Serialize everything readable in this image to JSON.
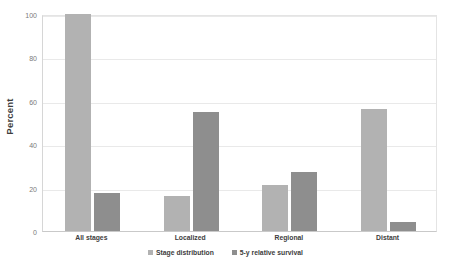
{
  "chart_data": {
    "type": "bar",
    "title": "",
    "xlabel": "",
    "ylabel": "Percent",
    "ylim": [
      0,
      100
    ],
    "yticks": [
      0,
      20,
      40,
      60,
      80,
      100
    ],
    "ytick_labels": [
      "0",
      "20",
      "40",
      "60",
      "80",
      "100"
    ],
    "grid": true,
    "legend_position": "bottom",
    "categories": [
      "All stages",
      "Localized",
      "Regional",
      "Distant"
    ],
    "series": [
      {
        "name": "Stage distribution",
        "color": "#b2b2b2",
        "values": [
          100,
          16,
          21,
          56
        ]
      },
      {
        "name": "5-y relative survival",
        "color": "#8e8e8e",
        "values": [
          17.5,
          55,
          27,
          4
        ]
      }
    ]
  },
  "axis": {
    "y_title": "Percent"
  },
  "legend": {
    "items": [
      {
        "label": "Stage distribution",
        "marker": "square-swatch-light"
      },
      {
        "label": "5-y relative survival",
        "marker": "square-swatch-dark"
      }
    ]
  }
}
